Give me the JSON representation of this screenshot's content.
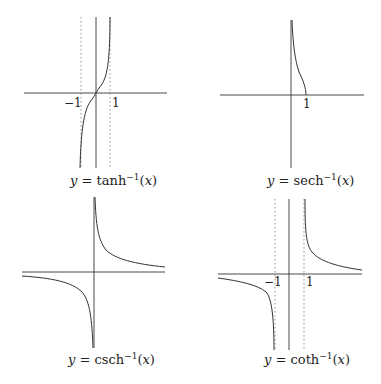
{
  "panels": [
    {
      "name": "tanh-inverse",
      "caption": {
        "lhs": "y",
        "eq": " = ",
        "fn": "tanh",
        "sup": "−1",
        "arg_open": "(",
        "arg": "x",
        "arg_close": ")"
      },
      "ticks": {
        "neg_one": "−1",
        "one": "1"
      }
    },
    {
      "name": "sech-inverse",
      "caption": {
        "lhs": "y",
        "eq": " = ",
        "fn": "sech",
        "sup": "−1",
        "arg_open": "(",
        "arg": "x",
        "arg_close": ")"
      },
      "ticks": {
        "one": "1"
      }
    },
    {
      "name": "csch-inverse",
      "caption": {
        "lhs": "y",
        "eq": " = ",
        "fn": "csch",
        "sup": "−1",
        "arg_open": "(",
        "arg": "x",
        "arg_close": ")"
      },
      "ticks": {}
    },
    {
      "name": "coth-inverse",
      "caption": {
        "lhs": "y",
        "eq": " = ",
        "fn": "coth",
        "sup": "−1",
        "arg_open": "(",
        "arg": "x",
        "arg_close": ")"
      },
      "ticks": {
        "neg_one": "−1",
        "one": "1"
      }
    }
  ],
  "colors": {
    "line": "#333333",
    "asymptote": "#777777",
    "background": "#ffffff"
  }
}
